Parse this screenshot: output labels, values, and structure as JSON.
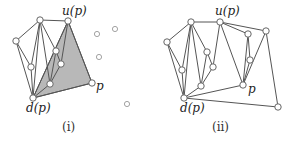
{
  "panels": [
    {
      "id": "i",
      "caption": "(i)",
      "labels": {
        "u": "u(p)",
        "d": "d(p)",
        "p": "p"
      },
      "shaded_triangle": [
        [
          68,
          21
        ],
        [
          92,
          83
        ],
        [
          33,
          98
        ]
      ],
      "vertices": [
        [
          16,
          41
        ],
        [
          40,
          20
        ],
        [
          68,
          21
        ],
        [
          31,
          67
        ],
        [
          56,
          51
        ],
        [
          61,
          64
        ],
        [
          50,
          84
        ],
        [
          33,
          98
        ],
        [
          92,
          83
        ]
      ],
      "edges": [
        [
          [
            16,
            41
          ],
          [
            40,
            20
          ]
        ],
        [
          [
            40,
            20
          ],
          [
            68,
            21
          ]
        ],
        [
          [
            16,
            41
          ],
          [
            33,
            98
          ]
        ],
        [
          [
            16,
            41
          ],
          [
            31,
            67
          ]
        ],
        [
          [
            40,
            20
          ],
          [
            31,
            67
          ]
        ],
        [
          [
            40,
            20
          ],
          [
            33,
            98
          ]
        ],
        [
          [
            40,
            20
          ],
          [
            50,
            84
          ]
        ],
        [
          [
            40,
            20
          ],
          [
            56,
            51
          ]
        ],
        [
          [
            56,
            51
          ],
          [
            50,
            84
          ]
        ],
        [
          [
            56,
            51
          ],
          [
            61,
            64
          ]
        ],
        [
          [
            61,
            64
          ],
          [
            50,
            84
          ]
        ],
        [
          [
            61,
            64
          ],
          [
            68,
            21
          ]
        ],
        [
          [
            31,
            67
          ],
          [
            33,
            98
          ]
        ],
        [
          [
            50,
            84
          ],
          [
            33,
            98
          ]
        ],
        [
          [
            68,
            21
          ],
          [
            92,
            83
          ]
        ],
        [
          [
            92,
            83
          ],
          [
            33,
            98
          ]
        ],
        [
          [
            68,
            21
          ],
          [
            33,
            98
          ]
        ]
      ],
      "unprocessed_points": [
        [
          97,
          34
        ],
        [
          115,
          29
        ],
        [
          99,
          57
        ],
        [
          127,
          104
        ]
      ]
    },
    {
      "id": "ii",
      "caption": "(ii)",
      "labels": {
        "u": "u(p)",
        "d": "d(p)",
        "p": "p"
      },
      "vertices": [
        [
          167,
          42
        ],
        [
          191,
          22
        ],
        [
          220,
          22
        ],
        [
          182,
          70
        ],
        [
          207,
          52
        ],
        [
          213,
          67
        ],
        [
          201,
          86
        ],
        [
          184,
          98
        ],
        [
          243,
          85
        ],
        [
          248,
          34
        ],
        [
          250,
          60
        ],
        [
          266,
          31
        ],
        [
          278,
          107
        ]
      ],
      "edges": [
        [
          [
            167,
            42
          ],
          [
            191,
            22
          ]
        ],
        [
          [
            191,
            22
          ],
          [
            220,
            22
          ]
        ],
        [
          [
            167,
            42
          ],
          [
            184,
            98
          ]
        ],
        [
          [
            167,
            42
          ],
          [
            182,
            70
          ]
        ],
        [
          [
            191,
            22
          ],
          [
            182,
            70
          ]
        ],
        [
          [
            191,
            22
          ],
          [
            184,
            98
          ]
        ],
        [
          [
            191,
            22
          ],
          [
            201,
            86
          ]
        ],
        [
          [
            191,
            22
          ],
          [
            207,
            52
          ]
        ],
        [
          [
            207,
            52
          ],
          [
            201,
            86
          ]
        ],
        [
          [
            207,
            52
          ],
          [
            213,
            67
          ]
        ],
        [
          [
            213,
            67
          ],
          [
            201,
            86
          ]
        ],
        [
          [
            213,
            67
          ],
          [
            220,
            22
          ]
        ],
        [
          [
            182,
            70
          ],
          [
            184,
            98
          ]
        ],
        [
          [
            201,
            86
          ],
          [
            184,
            98
          ]
        ],
        [
          [
            220,
            22
          ],
          [
            243,
            85
          ]
        ],
        [
          [
            243,
            85
          ],
          [
            184,
            98
          ]
        ],
        [
          [
            220,
            22
          ],
          [
            248,
            34
          ]
        ],
        [
          [
            220,
            22
          ],
          [
            266,
            31
          ]
        ],
        [
          [
            248,
            34
          ],
          [
            250,
            60
          ]
        ],
        [
          [
            248,
            34
          ],
          [
            243,
            85
          ]
        ],
        [
          [
            250,
            60
          ],
          [
            243,
            85
          ]
        ],
        [
          [
            266,
            31
          ],
          [
            243,
            85
          ]
        ],
        [
          [
            266,
            31
          ],
          [
            278,
            107
          ]
        ],
        [
          [
            278,
            107
          ],
          [
            184,
            98
          ]
        ]
      ]
    }
  ]
}
